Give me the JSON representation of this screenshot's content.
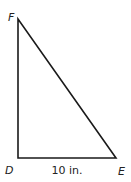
{
  "diagram": {
    "type": "right-triangle",
    "vertices": {
      "F": {
        "label": "F",
        "x": 18,
        "y": 19
      },
      "D": {
        "label": "D",
        "x": 18,
        "y": 158
      },
      "E": {
        "label": "E",
        "x": 116,
        "y": 158
      }
    },
    "right_angle_at": "D",
    "side_labels": {
      "DE": "10 in."
    },
    "stroke_color": "#1a1a1a"
  }
}
